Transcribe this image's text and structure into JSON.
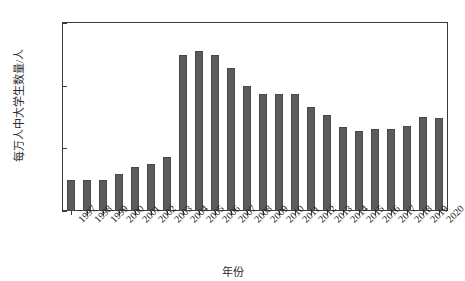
{
  "chart_data": {
    "type": "bar",
    "title": "",
    "xlabel": "年份",
    "ylabel": "每万人中大学生数量/人",
    "categories": [
      "1997",
      "1998",
      "1999",
      "2000",
      "2001",
      "2002",
      "2003",
      "2004",
      "2005",
      "2006",
      "2007",
      "2008",
      "2009",
      "2010",
      "2011",
      "2012",
      "2013",
      "2014",
      "2015",
      "2016",
      "2017",
      "2018",
      "2019",
      "2020"
    ],
    "values": [
      100,
      98,
      100,
      118,
      140,
      150,
      172,
      498,
      512,
      498,
      458,
      400,
      375,
      372,
      372,
      332,
      305,
      268,
      255,
      262,
      262,
      272,
      300,
      297
    ],
    "ylim": [
      0,
      600
    ],
    "yticks": [
      0,
      200,
      400,
      600
    ],
    "grid": false,
    "legend": null,
    "bar_color": "#5b5b5b"
  },
  "axes": {
    "y_title": "每万人中大学生数量/人",
    "x_title": "年份",
    "y_tick_labels": [
      "600",
      "400",
      "200",
      "0"
    ]
  }
}
